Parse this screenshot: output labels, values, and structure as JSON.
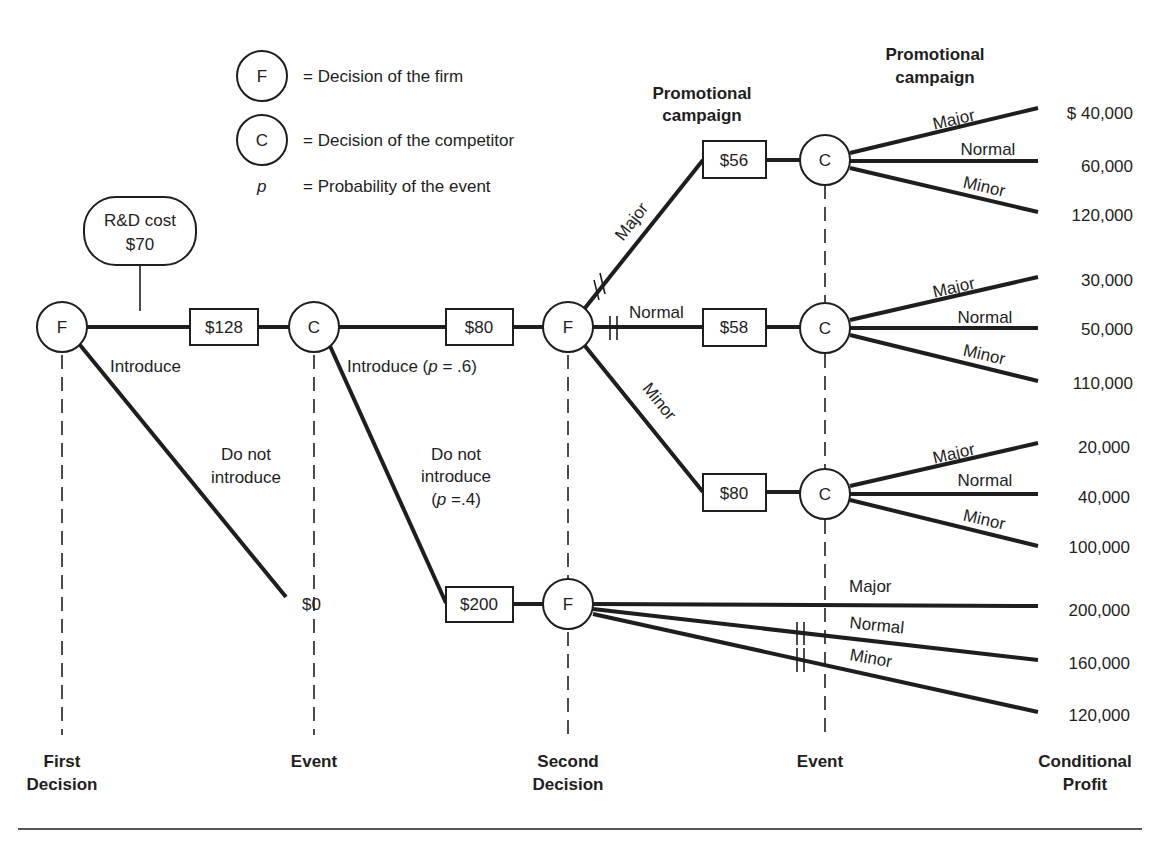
{
  "legend": {
    "firm_symbol": "F",
    "firm_desc": "= Decision of the firm",
    "competitor_symbol": "C",
    "competitor_desc": "= Decision of the competitor",
    "prob_symbol": "p",
    "prob_desc": "= Probability of the event"
  },
  "rd_cost": {
    "line1": "R&D cost",
    "line2": "$70"
  },
  "nodes": {
    "first_decision": "F",
    "event1": "C",
    "second_decision_top": "F",
    "second_decision_bottom": "F",
    "event_major": "C",
    "event_normal": "C",
    "event_minor": "C"
  },
  "values": {
    "introduce_box": "$128",
    "competitor_introduce_box": "$80",
    "competitor_not_box": "$200",
    "major_box": "$56",
    "normal_box": "$58",
    "minor_box": "$80",
    "no_introduce_value": "$0"
  },
  "branch_labels": {
    "introduce": "Introduce",
    "do_not_introduce_1": "Do not",
    "do_not_introduce_2": "introduce",
    "comp_introduce": "Introduce (",
    "comp_introduce_p": "p",
    "comp_introduce_val": " = .6)",
    "comp_not_1": "Do not",
    "comp_not_2": "introduce",
    "comp_not_3a": "(",
    "comp_not_3p": "p",
    "comp_not_3b": " =.4)",
    "major": "Major",
    "normal": "Normal",
    "minor": "Minor"
  },
  "headers": {
    "promo_mid_1": "Promotional",
    "promo_mid_2": "campaign",
    "promo_right_1": "Promotional",
    "promo_right_2": "campaign"
  },
  "profits": {
    "major_branch": [
      "$  40,000",
      "60,000",
      "120,000"
    ],
    "normal_branch": [
      "30,000",
      "50,000",
      "110,000"
    ],
    "minor_branch": [
      "20,000",
      "40,000",
      "100,000"
    ],
    "no_competitor": [
      "200,000",
      "160,000",
      "120,000"
    ]
  },
  "stages": {
    "first_1": "First",
    "first_2": "Decision",
    "event_a": "Event",
    "second_1": "Second",
    "second_2": "Decision",
    "event_b": "Event",
    "profit_1": "Conditional",
    "profit_2": "Profit"
  }
}
